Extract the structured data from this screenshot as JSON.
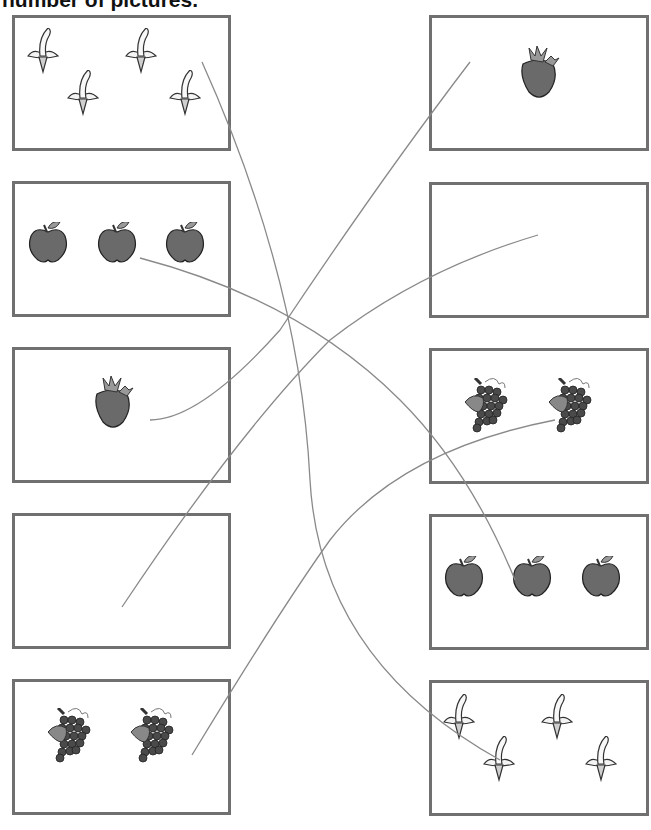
{
  "header": {
    "text": "number of pictures."
  },
  "left_column": [
    {
      "fruit": "banana",
      "count": 4
    },
    {
      "fruit": "apple",
      "count": 3
    },
    {
      "fruit": "strawberry",
      "count": 1
    },
    {
      "fruit": "none",
      "count": 0
    },
    {
      "fruit": "grapes",
      "count": 2
    }
  ],
  "right_column": [
    {
      "fruit": "strawberry",
      "count": 1
    },
    {
      "fruit": "none",
      "count": 0
    },
    {
      "fruit": "grapes",
      "count": 2
    },
    {
      "fruit": "apple",
      "count": 3
    },
    {
      "fruit": "banana",
      "count": 4
    }
  ],
  "colors": {
    "box_border": "#707070",
    "line": "#8a8a8a",
    "fruit_dark": "#555555"
  }
}
